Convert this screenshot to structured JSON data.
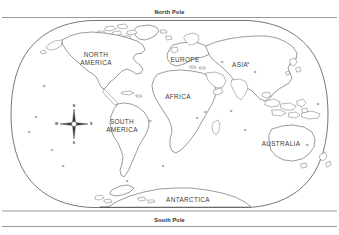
{
  "map": {
    "title": "World Map Outline",
    "projection": "oval world projection",
    "background_color": "#ffffff",
    "outline_color": "#4a4a4a",
    "label_color": "#3a3a3a",
    "pole_label_color": "#2b2b2b",
    "poles": {
      "north": "North Pole",
      "south": "South Pole"
    },
    "continents": [
      {
        "id": "north-america",
        "label_line1": "NORTH",
        "label_line2": "AMERICA",
        "x": 96,
        "y": 57
      },
      {
        "id": "south-america",
        "label_line1": "SOUTH",
        "label_line2": "AMERICA",
        "x": 122,
        "y": 124
      },
      {
        "id": "europe",
        "label_line1": "EUROPE",
        "label_line2": "",
        "x": 185,
        "y": 62
      },
      {
        "id": "africa",
        "label_line1": "AFRICA",
        "label_line2": "",
        "x": 178,
        "y": 99
      },
      {
        "id": "asia",
        "label_line1": "ASIA",
        "label_line2": "",
        "x": 240,
        "y": 67
      },
      {
        "id": "australia",
        "label_line1": "AUSTRALIA",
        "label_line2": "",
        "x": 281,
        "y": 146
      },
      {
        "id": "antarctica",
        "label_line1": "ANTARCTICA",
        "label_line2": "",
        "x": 188,
        "y": 202
      }
    ],
    "compass_rose": {
      "north": "N",
      "east": "E",
      "south": "S",
      "west": "W",
      "center_x": 74,
      "center_y": 124
    }
  }
}
